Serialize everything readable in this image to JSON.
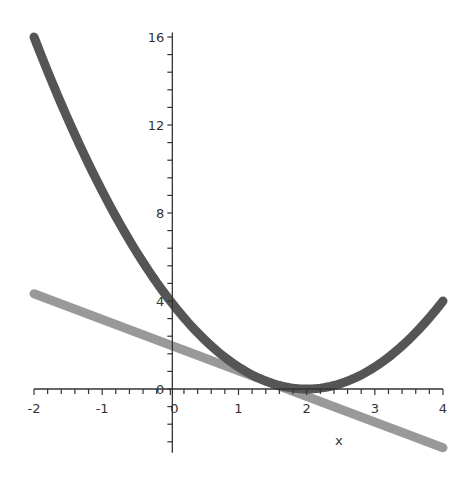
{
  "chart_data": {
    "type": "line",
    "title": "",
    "xlabel": "x",
    "ylabel": "",
    "xlim": [
      -2,
      4
    ],
    "ylim": [
      -3,
      16.5
    ],
    "grid": false,
    "legend": null,
    "x_ticks": [
      "-2",
      "-1",
      "0",
      "1",
      "2",
      "3",
      "4"
    ],
    "y_ticks": [
      "0",
      "4",
      "8",
      "12",
      "16"
    ],
    "series": [
      {
        "name": "(x-2)^2",
        "color": "#555555",
        "x": [
          -2,
          -1.5,
          -1,
          -0.5,
          0,
          0.5,
          1,
          1.5,
          2,
          2.5,
          3,
          3.5,
          4
        ],
        "y": [
          16,
          12.25,
          9,
          6.25,
          4,
          2.25,
          1,
          0.25,
          0,
          0.25,
          1,
          2.25,
          4
        ]
      },
      {
        "name": "line",
        "color": "#999999",
        "x": [
          -2,
          4
        ],
        "y": [
          4.33,
          -2.67
        ]
      }
    ]
  }
}
